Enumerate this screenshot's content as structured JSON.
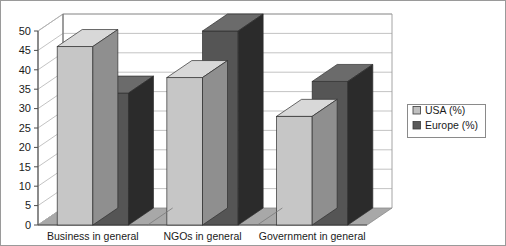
{
  "chart_data": {
    "type": "bar",
    "title": "",
    "subtitle": "",
    "xlabel": "",
    "ylabel": "",
    "categories": [
      "Business in general",
      "NGOs in general",
      "Government in general"
    ],
    "series": [
      {
        "name": "USA (%)",
        "values": [
          46,
          38,
          28
        ],
        "color": "#c0c0c0"
      },
      {
        "name": "Europe (%)",
        "values": [
          34,
          50,
          37
        ],
        "color": "#595959"
      }
    ],
    "ylim": [
      0,
      50
    ],
    "ytick_step": 5,
    "yticks": [
      0,
      5,
      10,
      15,
      20,
      25,
      30,
      35,
      40,
      45,
      50
    ],
    "ytick_labels": [
      "0",
      "5",
      "10",
      "15",
      "20",
      "25",
      "30",
      "35",
      "40",
      "45",
      "50"
    ],
    "grid": true,
    "grid_axis": "y",
    "legend_position": "right",
    "three_d": true,
    "annotations": []
  },
  "legend": {
    "entries": [
      {
        "label": "USA (%)",
        "swatch_color": "#c0c0c0"
      },
      {
        "label": "Europe (%)",
        "swatch_color": "#595959"
      }
    ]
  },
  "colors": {
    "background": "#ffffff",
    "plot_wall": "#ffffff",
    "floor": "#a8a8a8",
    "side_wall": "#ffffff",
    "grid_line": "#b4b4b4",
    "axis_line": "#4d4d4d",
    "frame": "#6e6e6e",
    "series_usa_front": "#c6c6c6",
    "series_usa_top": "#d8d8d8",
    "series_usa_side": "#8f8f8f",
    "series_europe_front": "#555555",
    "series_europe_top": "#6b6b6b",
    "series_europe_side": "#2b2b2b",
    "text": "#1a1a1a"
  }
}
